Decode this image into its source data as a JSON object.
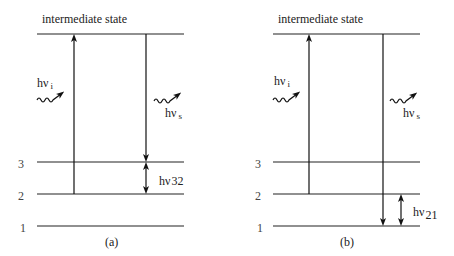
{
  "diagram": {
    "type": "energy-level diagram (Raman scattering)",
    "panels": [
      {
        "id": "a",
        "caption": "(a)",
        "top_label": "intermediate state",
        "levels": [
          "1",
          "2",
          "3"
        ],
        "incident_photon": {
          "base": "hν",
          "sub": "i"
        },
        "scattered_photon": {
          "base": "hν",
          "sub": "s"
        },
        "transition_label": {
          "base": "hν",
          "sub": "32"
        },
        "excitation_from_level": "2",
        "emission_to_level": "3"
      },
      {
        "id": "b",
        "caption": "(b)",
        "top_label": "intermediate state",
        "levels": [
          "1",
          "2",
          "3"
        ],
        "incident_photon": {
          "base": "hν",
          "sub": "i"
        },
        "scattered_photon": {
          "base": "hν",
          "sub": "s"
        },
        "transition_label": {
          "base": "hν",
          "sub": "21"
        },
        "excitation_from_level": "2",
        "emission_to_level": "1"
      }
    ]
  }
}
